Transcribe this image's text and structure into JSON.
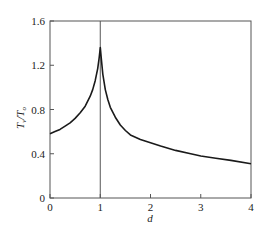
{
  "chart_data": {
    "type": "line",
    "title": "",
    "xlabel": "d",
    "ylabel": "T_v/T_o",
    "ylabel_parts": {
      "main1": "T",
      "sub1": "v",
      "slash": "/",
      "main2": "T",
      "sub2": "o"
    },
    "xlim": [
      0,
      4
    ],
    "ylim": [
      0,
      1.6
    ],
    "xticks": [
      0,
      1,
      2,
      3,
      4
    ],
    "yticks": [
      0,
      0.4,
      0.8,
      1.2,
      1.6
    ],
    "xtick_labels": [
      "0",
      "1",
      "2",
      "3",
      "4"
    ],
    "ytick_labels": [
      "0",
      "0.4",
      "0.8",
      "1.2",
      "1.6"
    ],
    "grid": false,
    "legend": null,
    "vertical_reference_line": {
      "x": 1
    },
    "series": [
      {
        "name": "T_v/T_o",
        "color": "#1a1a1a",
        "x": [
          0,
          0.1,
          0.2,
          0.3,
          0.4,
          0.5,
          0.6,
          0.7,
          0.8,
          0.85,
          0.9,
          0.95,
          0.98,
          1.0,
          1.02,
          1.05,
          1.1,
          1.15,
          1.2,
          1.3,
          1.4,
          1.5,
          1.6,
          1.8,
          2.0,
          2.2,
          2.5,
          2.8,
          3.0,
          3.3,
          3.6,
          4.0
        ],
        "y": [
          0.58,
          0.6,
          0.62,
          0.65,
          0.68,
          0.72,
          0.77,
          0.83,
          0.92,
          0.98,
          1.06,
          1.17,
          1.27,
          1.36,
          1.26,
          1.12,
          0.98,
          0.89,
          0.82,
          0.73,
          0.66,
          0.61,
          0.57,
          0.53,
          0.5,
          0.47,
          0.43,
          0.4,
          0.38,
          0.36,
          0.34,
          0.31
        ]
      }
    ]
  }
}
